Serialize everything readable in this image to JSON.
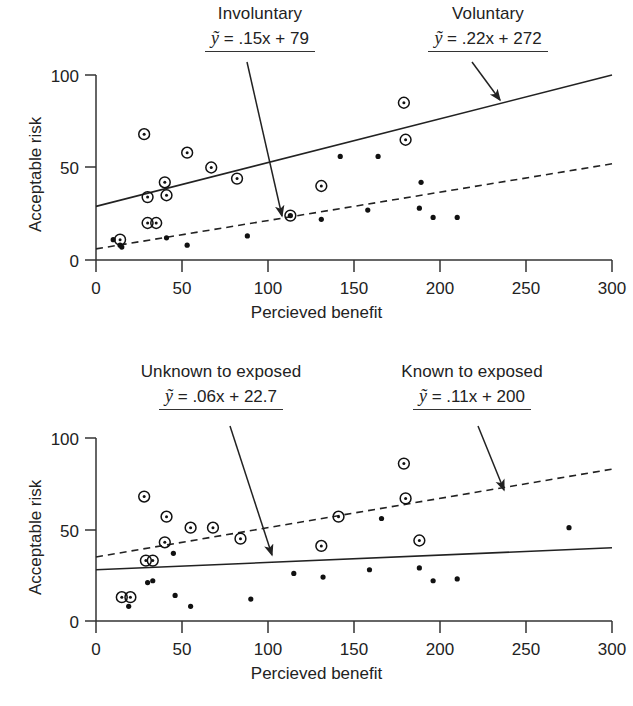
{
  "figure": {
    "x_axis_label": "Percieved benefit",
    "y_axis_label": "Acceptable risk",
    "x_ticks": [
      "0",
      "50",
      "100",
      "150",
      "200",
      "250",
      "300"
    ],
    "y_ticks": [
      "0",
      "50",
      "100"
    ],
    "line_color": "#222222",
    "marker_color": "#111111"
  },
  "panels": [
    {
      "id": "top",
      "annotations": [
        {
          "category": "Involuntary",
          "equation_prefix": "y",
          "equation_body": " = .15x + 79",
          "equation_full": "ỹ = .15x + 79",
          "slope": 0.15,
          "intercept_label": "79",
          "target_line": "dashed"
        },
        {
          "category": "Voluntary",
          "equation_prefix": "y",
          "equation_body": " = .22x + 272",
          "equation_full": "ỹ = .22x + 272",
          "slope": 0.22,
          "intercept_label": "272",
          "target_line": "solid"
        }
      ]
    },
    {
      "id": "bottom",
      "annotations": [
        {
          "category": "Unknown to exposed",
          "equation_prefix": "y",
          "equation_body": " = .06x + 22.7",
          "equation_full": "ỹ = .06x + 22.7",
          "slope": 0.06,
          "intercept_label": "22.7",
          "target_line": "solid"
        },
        {
          "category": "Known to exposed",
          "equation_prefix": "y",
          "equation_body": " = .11x + 200",
          "equation_full": "ỹ = .11x + 200",
          "slope": 0.11,
          "intercept_label": "200",
          "target_line": "dashed"
        }
      ]
    }
  ],
  "chart_data": [
    {
      "type": "scatter",
      "panel": "top",
      "title": "",
      "xlabel": "Percieved benefit",
      "ylabel": "Acceptable risk",
      "xlim": [
        0,
        300
      ],
      "ylim": [
        0,
        100
      ],
      "xticks": [
        0,
        50,
        100,
        150,
        200,
        250,
        300
      ],
      "yticks": [
        0,
        50,
        100
      ],
      "grid": false,
      "legend": "annotations",
      "series": [
        {
          "name": "Voluntary",
          "marker": "circled-dot",
          "fit_line": "solid",
          "fit_equation": "y = .22x + 272",
          "fit_endpoints": [
            [
              0,
              29
            ],
            [
              300,
              100
            ]
          ],
          "points": [
            [
              14,
              11
            ],
            [
              28,
              68
            ],
            [
              30,
              34
            ],
            [
              30,
              20
            ],
            [
              35,
              20
            ],
            [
              40,
              42
            ],
            [
              41,
              35
            ],
            [
              53,
              58
            ],
            [
              67,
              50
            ],
            [
              82,
              44
            ],
            [
              113,
              24
            ],
            [
              131,
              40
            ],
            [
              179,
              85
            ],
            [
              180,
              65
            ]
          ]
        },
        {
          "name": "Involuntary",
          "marker": "dot",
          "fit_line": "dashed",
          "fit_equation": "y = .15x + 79",
          "fit_endpoints": [
            [
              0,
              6
            ],
            [
              300,
              52
            ]
          ],
          "points": [
            [
              10,
              11
            ],
            [
              14,
              8
            ],
            [
              15,
              7
            ],
            [
              41,
              12
            ],
            [
              53,
              8
            ],
            [
              88,
              13
            ],
            [
              113,
              24
            ],
            [
              131,
              22
            ],
            [
              142,
              56
            ],
            [
              158,
              27
            ],
            [
              164,
              56
            ],
            [
              188,
              28
            ],
            [
              189,
              42
            ],
            [
              196,
              23
            ],
            [
              210,
              23
            ]
          ]
        }
      ]
    },
    {
      "type": "scatter",
      "panel": "bottom",
      "title": "",
      "xlabel": "Percieved benefit",
      "ylabel": "Acceptable risk",
      "xlim": [
        0,
        300
      ],
      "ylim": [
        0,
        100
      ],
      "xticks": [
        0,
        50,
        100,
        150,
        200,
        250,
        300
      ],
      "yticks": [
        0,
        50,
        100
      ],
      "grid": false,
      "legend": "annotations",
      "series": [
        {
          "name": "Known to exposed",
          "marker": "circled-dot",
          "fit_line": "dashed",
          "fit_equation": "y = .11x + 200",
          "fit_endpoints": [
            [
              0,
              35
            ],
            [
              300,
              83
            ]
          ],
          "points": [
            [
              15,
              13
            ],
            [
              20,
              13
            ],
            [
              28,
              68
            ],
            [
              29,
              33
            ],
            [
              33,
              33
            ],
            [
              40,
              43
            ],
            [
              41,
              57
            ],
            [
              55,
              51
            ],
            [
              68,
              51
            ],
            [
              84,
              45
            ],
            [
              131,
              41
            ],
            [
              141,
              57
            ],
            [
              179,
              86
            ],
            [
              180,
              67
            ],
            [
              188,
              44
            ]
          ]
        },
        {
          "name": "Unknown to exposed",
          "marker": "dot",
          "fit_line": "solid",
          "fit_equation": "y = .06x + 22.7",
          "fit_endpoints": [
            [
              0,
              28
            ],
            [
              300,
              40
            ]
          ],
          "points": [
            [
              19,
              8
            ],
            [
              30,
              21
            ],
            [
              33,
              22
            ],
            [
              45,
              37
            ],
            [
              46,
              14
            ],
            [
              55,
              8
            ],
            [
              90,
              12
            ],
            [
              115,
              26
            ],
            [
              132,
              24
            ],
            [
              159,
              28
            ],
            [
              166,
              56
            ],
            [
              188,
              29
            ],
            [
              196,
              22
            ],
            [
              210,
              23
            ],
            [
              275,
              51
            ]
          ]
        }
      ]
    }
  ]
}
